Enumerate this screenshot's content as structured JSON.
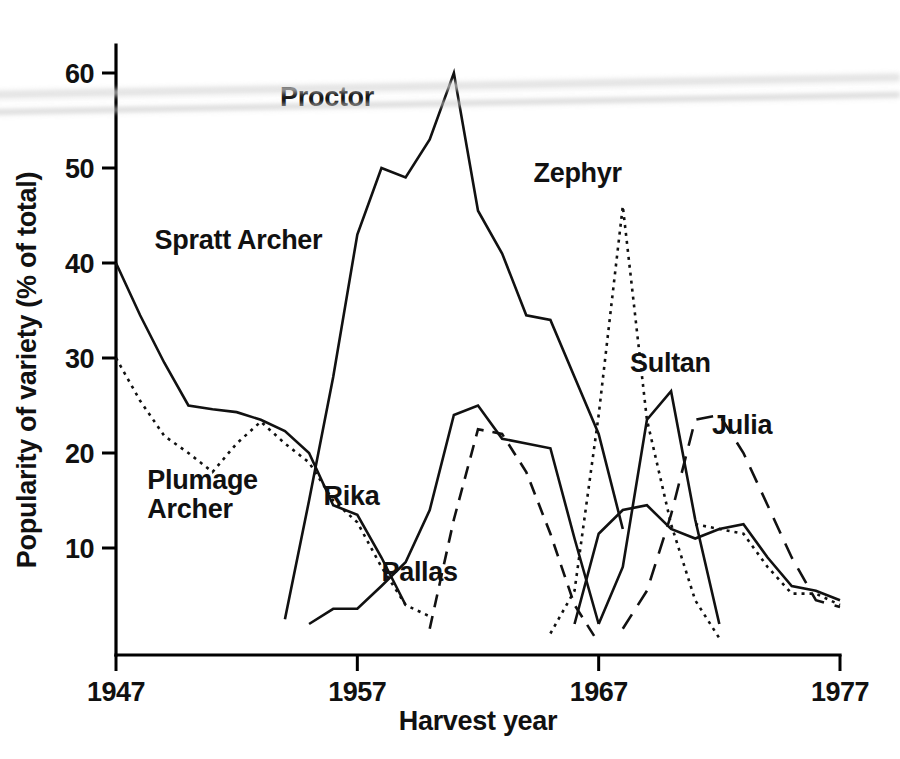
{
  "chart_data": {
    "type": "line",
    "title": "",
    "xlabel": "Harvest year",
    "ylabel": "Popularity of variety (% of total)",
    "xlim": [
      1947,
      1977
    ],
    "ylim": [
      0,
      64
    ],
    "xticks": [
      1947,
      1957,
      1967,
      1977
    ],
    "xtick_labels": [
      "1947",
      "1957",
      "1967",
      "1977"
    ],
    "yticks": [
      10,
      20,
      30,
      40,
      50,
      60
    ],
    "ytick_labels": [
      "10",
      "20",
      "30",
      "40",
      "50",
      "60"
    ],
    "grid": false,
    "legend": "inline-labels",
    "series": [
      {
        "name": "Spratt Archer",
        "style": "solid",
        "label_x": 1948.6,
        "label_y": 41.5,
        "x": [
          1947,
          1948,
          1949,
          1950,
          1951,
          1952,
          1953,
          1954,
          1955,
          1956,
          1957,
          1958,
          1959
        ],
        "y": [
          40.0,
          34.5,
          29.5,
          25.0,
          24.6,
          24.3,
          23.5,
          22.3,
          20.0,
          14.5,
          13.5,
          9.0,
          4.0
        ]
      },
      {
        "name": "Plumage Archer",
        "style": "dotted",
        "label_x": 1948.3,
        "label_y": 16.2,
        "x": [
          1947,
          1948,
          1949,
          1950,
          1951,
          1952,
          1953,
          1954,
          1955,
          1956,
          1957,
          1958,
          1959,
          1960
        ],
        "y": [
          30.0,
          25.5,
          21.8,
          20.0,
          18.0,
          21.0,
          23.3,
          21.0,
          19.0,
          15.0,
          12.7,
          8.0,
          4.0,
          2.8
        ]
      },
      {
        "name": "Proctor",
        "style": "solid",
        "label_x": 1953.8,
        "label_y": 56.5,
        "x": [
          1954,
          1955,
          1956,
          1957,
          1958,
          1959,
          1960,
          1961,
          1962,
          1963,
          1964,
          1965,
          1966,
          1967,
          1968
        ],
        "y": [
          2.5,
          15.0,
          28.0,
          43.0,
          50.0,
          49.0,
          53.0,
          60.0,
          45.5,
          41.0,
          34.5,
          34.0,
          28.0,
          22.0,
          12.0
        ]
      },
      {
        "name": "Rika",
        "style": "solid",
        "label_x": 1955.6,
        "label_y": 14.5,
        "x": [
          1955,
          1956,
          1957,
          1958,
          1959,
          1960,
          1961,
          1962,
          1963,
          1964,
          1965,
          1966,
          1967
        ],
        "y": [
          2.0,
          3.6,
          3.6,
          6.0,
          8.5,
          14.0,
          24.0,
          25.0,
          21.5,
          21.0,
          20.5,
          11.0,
          2.0
        ]
      },
      {
        "name": "Pallas",
        "style": "dashed",
        "label_x": 1958.0,
        "label_y": 6.5,
        "x": [
          1960,
          1961,
          1962,
          1963,
          1964,
          1965,
          1966,
          1967
        ],
        "y": [
          1.5,
          13.0,
          22.5,
          22.0,
          18.0,
          11.5,
          4.0,
          0.0
        ]
      },
      {
        "name": "Zephyr",
        "style": "dotted",
        "label_x": 1964.3,
        "label_y": 48.5,
        "x": [
          1965,
          1966,
          1967,
          1968,
          1969,
          1970,
          1971,
          1972
        ],
        "y": [
          1.0,
          5.5,
          24.0,
          46.0,
          23.5,
          12.5,
          4.5,
          0.5
        ]
      },
      {
        "name": "Sultan",
        "style": "solid",
        "label_x": 1968.3,
        "label_y": 28.5,
        "x": [
          1967,
          1968,
          1969,
          1970,
          1971,
          1972
        ],
        "y": [
          2.0,
          8.0,
          23.5,
          26.5,
          13.0,
          2.0
        ]
      },
      {
        "name": "Julia",
        "style": "long-dashed",
        "label_x": 1971.7,
        "label_y": 22.0,
        "x": [
          1968,
          1969,
          1970,
          1971,
          1972,
          1973,
          1974,
          1975,
          1976,
          1977
        ],
        "y": [
          1.5,
          5.5,
          13.5,
          23.5,
          24.0,
          20.0,
          14.5,
          9.0,
          4.5,
          3.8
        ]
      },
      {
        "name": "Other-A",
        "style": "solid",
        "label_x": null,
        "label_y": null,
        "x": [
          1966,
          1967,
          1968,
          1969,
          1970,
          1971,
          1972,
          1973,
          1974,
          1975,
          1976,
          1977
        ],
        "y": [
          2.0,
          11.5,
          14.0,
          14.5,
          12.0,
          11.0,
          12.0,
          12.5,
          9.0,
          6.0,
          5.5,
          4.5
        ]
      },
      {
        "name": "Other-B",
        "style": "dotted",
        "label_x": null,
        "label_y": null,
        "x": [
          1971,
          1972,
          1973,
          1974,
          1975,
          1976,
          1977
        ],
        "y": [
          12.5,
          12.0,
          11.5,
          8.0,
          5.2,
          5.2,
          4.0
        ]
      }
    ]
  }
}
